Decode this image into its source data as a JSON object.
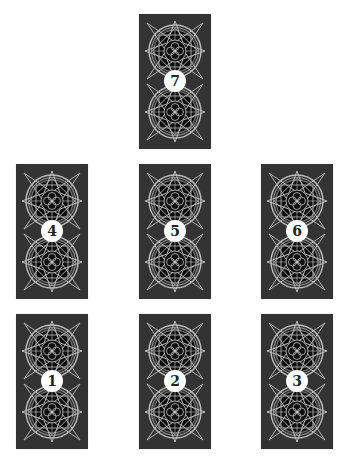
{
  "spread": {
    "card_back_color": "#333333",
    "ornament_color": "#bdbdbd",
    "badge_color": "#ffffff",
    "badge_text_color": "#222222",
    "cards": [
      {
        "position": "7",
        "label": "7",
        "x": 139,
        "y": 14
      },
      {
        "position": "4",
        "label": "4",
        "x": 16,
        "y": 164
      },
      {
        "position": "5",
        "label": "5",
        "x": 139,
        "y": 164
      },
      {
        "position": "6",
        "label": "6",
        "x": 261,
        "y": 164
      },
      {
        "position": "1",
        "label": "1",
        "x": 16,
        "y": 314
      },
      {
        "position": "2",
        "label": "2",
        "x": 139,
        "y": 314
      },
      {
        "position": "3",
        "label": "3",
        "x": 261,
        "y": 314
      }
    ]
  }
}
